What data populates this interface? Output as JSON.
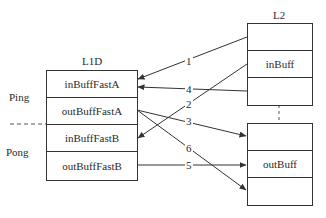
{
  "diagram": {
    "l1d": {
      "title": "L1D",
      "cells": [
        "inBuffFastA",
        "outBuffFastA",
        "inBuffFastB",
        "outBuffFastB"
      ]
    },
    "l2": {
      "title": "L2",
      "in_cells": [
        "",
        "inBuff",
        ""
      ],
      "out_cells": [
        "",
        "outBuff",
        ""
      ]
    },
    "groups": {
      "ping": "Ping",
      "pong": "Pong"
    },
    "arrows": [
      {
        "label": "1",
        "from": "L2.inBuff.row0",
        "to": "L1D.inBuffFastA"
      },
      {
        "label": "2",
        "from": "L2.inBuff.row1",
        "to": "L1D.inBuffFastB"
      },
      {
        "label": "3",
        "from": "L1D.outBuffFastA",
        "to": "L2.outBuff.row0"
      },
      {
        "label": "4",
        "from": "L2.inBuff.row2",
        "to": "L1D.inBuffFastA"
      },
      {
        "label": "5",
        "from": "L1D.outBuffFastB",
        "to": "L2.outBuff.row1"
      },
      {
        "label": "6",
        "from": "L1D.outBuffFastA",
        "to": "L2.outBuff.row2"
      }
    ],
    "colors": {
      "stroke": "#333333",
      "text": "#2a2a2a",
      "background": "#ffffff"
    }
  }
}
